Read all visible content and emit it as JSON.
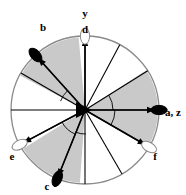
{
  "figure": {
    "type": "stereographic-projection",
    "title": "",
    "background": "#ffffff",
    "sector_fill_shaded": "#c9c9c9",
    "sector_fill_open": "#ffffff",
    "outline_color": "#8a8a8a",
    "line_color": "#000000",
    "pole_fill_solid": "#000000",
    "pole_fill_open": "#ffffff"
  },
  "circle": {
    "center_x": 85,
    "center_y": 110,
    "radius": 74
  },
  "labels": [
    {
      "id": "y",
      "text": "y",
      "x": 85,
      "y": 17,
      "anchor": "middle"
    },
    {
      "id": "d",
      "text": "d",
      "x": 85,
      "y": 33,
      "anchor": "middle"
    },
    {
      "id": "b",
      "text": "b",
      "x": 43,
      "y": 31,
      "anchor": "middle"
    },
    {
      "id": "az",
      "text": "a, z",
      "x": 165,
      "y": 116,
      "anchor": "start"
    },
    {
      "id": "e",
      "text": "e",
      "x": 12,
      "y": 160,
      "anchor": "middle"
    },
    {
      "id": "c",
      "text": "c",
      "x": 47,
      "y": 190,
      "anchor": "middle"
    },
    {
      "id": "f",
      "text": "f",
      "x": 155,
      "y": 160,
      "anchor": "middle"
    }
  ],
  "poles": [
    {
      "id": "pole-d",
      "label": "d",
      "angle_deg": 90,
      "filled": false
    },
    {
      "id": "pole-b",
      "label": "b",
      "angle_deg": 132,
      "filled": true
    },
    {
      "id": "pole-az",
      "label": "a, z",
      "angle_deg": 0,
      "filled": true
    },
    {
      "id": "pole-e",
      "label": "e",
      "angle_deg": 208,
      "filled": false
    },
    {
      "id": "pole-c",
      "label": "c",
      "angle_deg": 248,
      "filled": true
    },
    {
      "id": "pole-f",
      "label": "f",
      "angle_deg": 330,
      "filled": false
    }
  ],
  "sectors": [
    {
      "id": "sector-1",
      "start_deg": 0,
      "end_deg": 32,
      "shaded": false
    },
    {
      "id": "sector-2",
      "start_deg": 32,
      "end_deg": 62,
      "shaded": false
    },
    {
      "id": "sector-3",
      "start_deg": 62,
      "end_deg": 90,
      "shaded": false
    },
    {
      "id": "sector-4",
      "start_deg": 90,
      "end_deg": 150,
      "shaded": true
    },
    {
      "id": "sector-5",
      "start_deg": 150,
      "end_deg": 180,
      "shaded": false
    },
    {
      "id": "sector-6",
      "start_deg": 180,
      "end_deg": 212,
      "shaded": false
    },
    {
      "id": "sector-7",
      "start_deg": 212,
      "end_deg": 270,
      "shaded": true
    },
    {
      "id": "sector-8",
      "start_deg": 270,
      "end_deg": 300,
      "shaded": false
    },
    {
      "id": "sector-9",
      "start_deg": 300,
      "end_deg": 330,
      "shaded": false
    },
    {
      "id": "sector-10",
      "start_deg": 330,
      "end_deg": 360,
      "shaded": true
    }
  ],
  "shaded_wedges": [
    {
      "id": "wedge-upper-left",
      "start_deg": 95,
      "end_deg": 152
    },
    {
      "id": "wedge-upper-right",
      "start_deg": 0,
      "end_deg": 33
    },
    {
      "id": "wedge-lower-left",
      "start_deg": 212,
      "end_deg": 266
    },
    {
      "id": "wedge-lower-right",
      "start_deg": 330,
      "end_deg": 360
    }
  ],
  "radial_lines_deg": [
    0,
    32,
    62,
    90,
    132,
    150,
    180,
    208,
    248,
    270,
    300,
    330
  ],
  "arrows": [
    {
      "id": "arrow-d",
      "angle_deg": 90,
      "length": 72
    },
    {
      "id": "arrow-b",
      "angle_deg": 132,
      "length": 70
    },
    {
      "id": "arrow-az",
      "angle_deg": 0,
      "length": 70
    },
    {
      "id": "arrow-e",
      "angle_deg": 208,
      "length": 70
    },
    {
      "id": "arrow-c",
      "angle_deg": 248,
      "length": 72
    },
    {
      "id": "arrow-f",
      "angle_deg": 330,
      "length": 70
    }
  ],
  "angle_arcs": [
    {
      "id": "arc-right-upper",
      "radius": 28,
      "start_deg": 0,
      "end_deg": 32
    },
    {
      "id": "arc-right-lower",
      "radius": 30,
      "start_deg": 330,
      "end_deg": 360
    },
    {
      "id": "arc-upper-left",
      "radius": 26,
      "start_deg": 132,
      "end_deg": 160
    },
    {
      "id": "arc-lower-left",
      "radius": 26,
      "start_deg": 208,
      "end_deg": 248
    },
    {
      "id": "arc-bottom",
      "radius": 24,
      "start_deg": 248,
      "end_deg": 272
    }
  ]
}
